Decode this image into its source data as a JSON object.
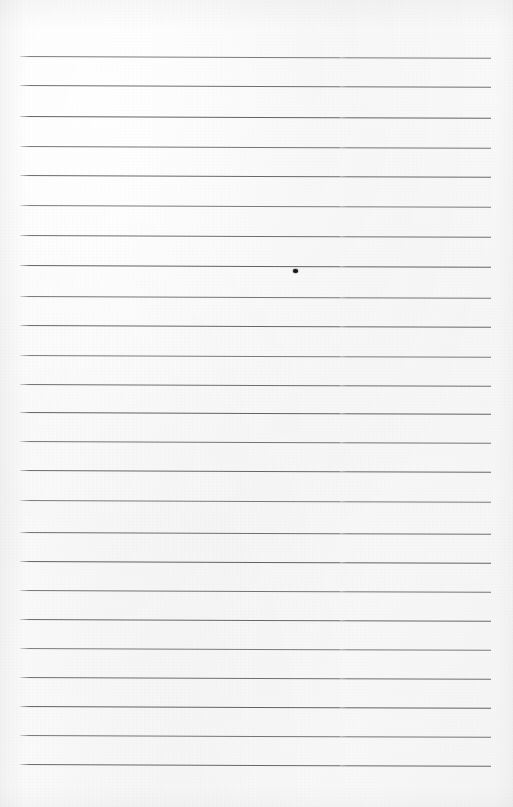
{
  "document": {
    "type": "scanned-lined-paper",
    "title": "Blank ruled notebook page",
    "page_width": 513,
    "page_height": 807,
    "visible_text": "",
    "note": "No printed or handwritten text is present on this page."
  },
  "paper": {
    "background_color": "#fafafa",
    "tint_color": "#f6f6f6",
    "edge_shadow_color": "#ededed"
  },
  "ruling": {
    "line_color": "#5c5c5c",
    "line_thickness_px": 1,
    "line_count": 25,
    "left_x": 20,
    "right_x": 491,
    "first_line_y": 56,
    "spacing_px": 29.5,
    "slant_deg": 0.22,
    "lines_y": [
      56,
      85,
      116,
      146,
      175,
      205,
      235,
      265,
      296,
      325,
      355,
      384,
      412,
      441,
      470,
      500,
      532,
      561,
      590,
      619,
      648,
      677,
      706,
      735,
      764
    ]
  },
  "marks": [
    {
      "name": "ink-dot",
      "shape": "dot",
      "x": 295,
      "y": 271,
      "width": 5,
      "height": 4,
      "color": "#171717"
    }
  ]
}
